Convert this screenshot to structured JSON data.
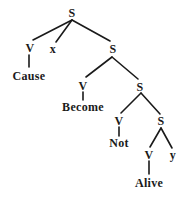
{
  "diagram": {
    "type": "syntax-tree",
    "nodes": {
      "s1": {
        "label": "S",
        "x": 72,
        "y": 13
      },
      "v1": {
        "label": "V",
        "x": 30,
        "y": 48
      },
      "x": {
        "label": "x",
        "x": 53,
        "y": 49
      },
      "cause": {
        "label": "Cause",
        "x": 29,
        "y": 76
      },
      "s2": {
        "label": "S",
        "x": 113,
        "y": 49
      },
      "v2": {
        "label": "V",
        "x": 83,
        "y": 86
      },
      "become": {
        "label": "Become",
        "x": 83,
        "y": 107
      },
      "s3": {
        "label": "S",
        "x": 140,
        "y": 87
      },
      "v3": {
        "label": "V",
        "x": 119,
        "y": 121
      },
      "not": {
        "label": "Not",
        "x": 119,
        "y": 143
      },
      "s4": {
        "label": "S",
        "x": 161,
        "y": 121
      },
      "v4": {
        "label": "V",
        "x": 149,
        "y": 155
      },
      "y": {
        "label": "y",
        "x": 173,
        "y": 155
      },
      "alive": {
        "label": "Alive",
        "x": 149,
        "y": 183
      }
    },
    "edges": [
      [
        "s1",
        "v1"
      ],
      [
        "s1",
        "x"
      ],
      [
        "s1",
        "s2"
      ],
      [
        "v1",
        "cause"
      ],
      [
        "s2",
        "v2"
      ],
      [
        "s2",
        "s3"
      ],
      [
        "v2",
        "become"
      ],
      [
        "s3",
        "v3"
      ],
      [
        "s3",
        "s4"
      ],
      [
        "v3",
        "not"
      ],
      [
        "s4",
        "v4"
      ],
      [
        "s4",
        "y"
      ],
      [
        "v4",
        "alive"
      ]
    ],
    "line_color": "#1a1a1a"
  }
}
